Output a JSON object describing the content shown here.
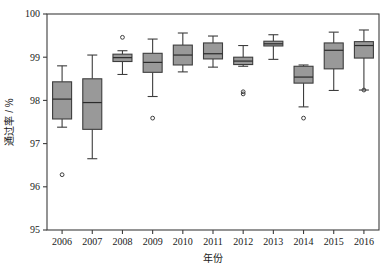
{
  "chart_data": {
    "type": "box",
    "title": "",
    "xlabel": "年份",
    "ylabel": "通过率 / %",
    "categories": [
      "2006",
      "2007",
      "2008",
      "2009",
      "2010",
      "2011",
      "2012",
      "2013",
      "2014",
      "2015",
      "2016"
    ],
    "ylim": [
      95,
      100
    ],
    "yticks": [
      95,
      96,
      97,
      98,
      99,
      100
    ],
    "ytick_labels": [
      "95",
      "96",
      "97",
      "98",
      "99",
      "100"
    ],
    "xtick_labels": [
      "2006",
      "2007",
      "2008",
      "2009",
      "2010",
      "2011",
      "2012",
      "2013",
      "2014",
      "2015",
      "2016"
    ],
    "grid": false,
    "legend": null,
    "box_fill": "#999999",
    "box_stroke": "#4d4d4d",
    "outlier_marker": "open-circle",
    "boxes": [
      {
        "category": "2006",
        "whisker_low": 97.38,
        "q1": 97.57,
        "median": 98.03,
        "q3": 98.43,
        "whisker_high": 98.8,
        "outliers": [
          96.28
        ]
      },
      {
        "category": "2007",
        "whisker_low": 96.65,
        "q1": 97.33,
        "median": 97.95,
        "q3": 98.5,
        "whisker_high": 99.05,
        "outliers": []
      },
      {
        "category": "2008",
        "whisker_low": 98.6,
        "q1": 98.9,
        "median": 98.99,
        "q3": 99.07,
        "whisker_high": 99.15,
        "outliers": [
          99.46
        ]
      },
      {
        "category": "2009",
        "whisker_low": 98.09,
        "q1": 98.65,
        "median": 98.88,
        "q3": 99.09,
        "whisker_high": 99.42,
        "outliers": [
          97.59
        ]
      },
      {
        "category": "2010",
        "whisker_low": 98.66,
        "q1": 98.82,
        "median": 99.05,
        "q3": 99.28,
        "whisker_high": 99.56,
        "outliers": []
      },
      {
        "category": "2011",
        "whisker_low": 98.77,
        "q1": 98.96,
        "median": 99.08,
        "q3": 99.33,
        "whisker_high": 99.49,
        "outliers": []
      },
      {
        "category": "2012",
        "whisker_low": 98.79,
        "q1": 98.83,
        "median": 98.91,
        "q3": 99.0,
        "whisker_high": 99.27,
        "outliers": [
          98.2,
          98.15
        ]
      },
      {
        "category": "2013",
        "whisker_low": 98.95,
        "q1": 99.26,
        "median": 99.31,
        "q3": 99.37,
        "whisker_high": 99.52,
        "outliers": []
      },
      {
        "category": "2014",
        "whisker_low": 97.85,
        "q1": 98.4,
        "median": 98.54,
        "q3": 98.79,
        "whisker_high": 98.82,
        "outliers": [
          97.59
        ]
      },
      {
        "category": "2015",
        "whisker_low": 98.23,
        "q1": 98.73,
        "median": 99.16,
        "q3": 99.33,
        "whisker_high": 99.58,
        "outliers": []
      },
      {
        "category": "2016",
        "whisker_low": 98.24,
        "q1": 98.98,
        "median": 99.27,
        "q3": 99.36,
        "whisker_high": 99.63,
        "outliers": [
          98.24
        ]
      }
    ]
  }
}
